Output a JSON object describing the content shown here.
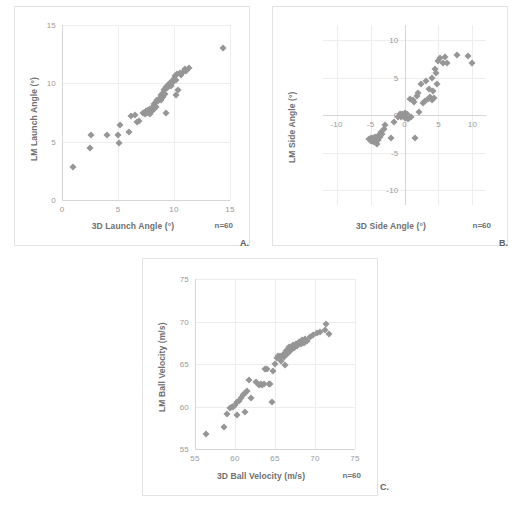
{
  "figure": {
    "caption": "",
    "panel_letters": {
      "a": "A.",
      "b": "B.",
      "c": "C."
    }
  },
  "colors": {
    "marker": "#969696",
    "grid": "#ededed",
    "axis": "#d6d6d6",
    "tick_text": "#9a9a9a",
    "title_text": "#6f6f6f",
    "panel_border": "#e3e3e3",
    "background": "#ffffff"
  },
  "chart_data": [
    {
      "id": "a",
      "type": "scatter",
      "title": "",
      "xlabel": "3D Launch Angle (°)",
      "ylabel": "LM Launch Angle (°)",
      "annotation": "n=60",
      "xlim": [
        0,
        15
      ],
      "ylim": [
        0,
        15
      ],
      "xticks": [
        0,
        5,
        10,
        15
      ],
      "yticks": [
        0,
        5,
        10,
        15
      ],
      "grid": true,
      "legend": "none",
      "n": 60,
      "points": [
        [
          1.0,
          2.8
        ],
        [
          2.5,
          4.5
        ],
        [
          2.6,
          5.6
        ],
        [
          4.0,
          5.6
        ],
        [
          5.0,
          5.6
        ],
        [
          5.1,
          4.9
        ],
        [
          5.2,
          6.4
        ],
        [
          6.0,
          5.8
        ],
        [
          6.2,
          7.2
        ],
        [
          6.5,
          7.3
        ],
        [
          6.7,
          6.7
        ],
        [
          6.9,
          6.8
        ],
        [
          7.2,
          7.5
        ],
        [
          7.4,
          7.4
        ],
        [
          7.5,
          7.6
        ],
        [
          7.6,
          7.5
        ],
        [
          7.7,
          7.7
        ],
        [
          7.8,
          7.6
        ],
        [
          7.9,
          7.8
        ],
        [
          7.9,
          7.4
        ],
        [
          8.0,
          7.9
        ],
        [
          8.0,
          7.6
        ],
        [
          8.1,
          8.0
        ],
        [
          8.2,
          7.8
        ],
        [
          8.2,
          8.2
        ],
        [
          8.3,
          8.1
        ],
        [
          8.4,
          8.4
        ],
        [
          8.4,
          8.0
        ],
        [
          8.5,
          8.6
        ],
        [
          8.6,
          8.5
        ],
        [
          8.7,
          8.7
        ],
        [
          8.8,
          8.6
        ],
        [
          8.8,
          9.0
        ],
        [
          8.9,
          8.9
        ],
        [
          9.0,
          9.2
        ],
        [
          9.0,
          8.8
        ],
        [
          9.1,
          9.4
        ],
        [
          9.2,
          9.5
        ],
        [
          9.2,
          9.1
        ],
        [
          9.3,
          9.7
        ],
        [
          9.3,
          7.5
        ],
        [
          9.4,
          9.6
        ],
        [
          9.5,
          9.9
        ],
        [
          9.6,
          10.0
        ],
        [
          9.7,
          9.8
        ],
        [
          9.8,
          10.2
        ],
        [
          9.9,
          10.1
        ],
        [
          10.0,
          10.4
        ],
        [
          10.1,
          10.6
        ],
        [
          10.2,
          10.3
        ],
        [
          10.2,
          9.0
        ],
        [
          10.3,
          10.8
        ],
        [
          10.4,
          9.4
        ],
        [
          10.5,
          10.9
        ],
        [
          10.6,
          10.7
        ],
        [
          10.8,
          11.0
        ],
        [
          11.0,
          11.2
        ],
        [
          11.1,
          11.1
        ],
        [
          11.3,
          11.3
        ],
        [
          14.4,
          13.0
        ]
      ]
    },
    {
      "id": "b",
      "type": "scatter",
      "title": "",
      "xlabel": "3D Side Angle (°)",
      "ylabel": "LM Side Angle (°)",
      "annotation": "n=60",
      "xlim": [
        -12,
        12
      ],
      "ylim": [
        -12,
        12
      ],
      "xticks": [
        -10,
        -5,
        0,
        5,
        10
      ],
      "yticks": [
        -10,
        -5,
        0,
        5,
        10
      ],
      "grid": true,
      "legend": "none",
      "n": 60,
      "points": [
        [
          -5.2,
          -3.2
        ],
        [
          -5.0,
          -3.4
        ],
        [
          -4.9,
          -3.1
        ],
        [
          -4.8,
          -3.5
        ],
        [
          -4.7,
          -3.0
        ],
        [
          -4.6,
          -3.3
        ],
        [
          -4.5,
          -3.6
        ],
        [
          -4.4,
          -2.9
        ],
        [
          -4.3,
          -3.2
        ],
        [
          -4.2,
          -3.4
        ],
        [
          -4.1,
          -3.8
        ],
        [
          -4.0,
          -3.1
        ],
        [
          -3.9,
          -3.3
        ],
        [
          -3.8,
          -2.6
        ],
        [
          -3.6,
          -2.9
        ],
        [
          -3.5,
          -2.2
        ],
        [
          -3.3,
          -2.5
        ],
        [
          -3.0,
          -1.8
        ],
        [
          -2.8,
          -1.3
        ],
        [
          -2.0,
          -3.0
        ],
        [
          -1.6,
          -0.9
        ],
        [
          -1.0,
          -0.2
        ],
        [
          -0.7,
          0.1
        ],
        [
          -0.5,
          -0.3
        ],
        [
          -0.3,
          0.2
        ],
        [
          -0.2,
          -0.1
        ],
        [
          0.0,
          0.3
        ],
        [
          0.1,
          -0.4
        ],
        [
          0.3,
          0.1
        ],
        [
          0.5,
          -0.5
        ],
        [
          0.8,
          2.2
        ],
        [
          1.0,
          -0.3
        ],
        [
          1.2,
          2.0
        ],
        [
          1.4,
          1.8
        ],
        [
          1.6,
          -3.0
        ],
        [
          1.8,
          2.6
        ],
        [
          2.0,
          3.0
        ],
        [
          2.2,
          0.4
        ],
        [
          2.5,
          4.2
        ],
        [
          2.7,
          1.6
        ],
        [
          3.0,
          1.9
        ],
        [
          3.2,
          4.6
        ],
        [
          3.4,
          2.1
        ],
        [
          3.6,
          3.5
        ],
        [
          3.8,
          2.4
        ],
        [
          4.0,
          5.0
        ],
        [
          4.1,
          2.0
        ],
        [
          4.2,
          3.2
        ],
        [
          4.3,
          2.3
        ],
        [
          4.5,
          6.2
        ],
        [
          4.7,
          5.6
        ],
        [
          5.0,
          7.2
        ],
        [
          5.3,
          7.6
        ],
        [
          5.6,
          7.0
        ],
        [
          5.9,
          7.8
        ],
        [
          6.2,
          6.9
        ],
        [
          7.8,
          8.0
        ],
        [
          9.4,
          7.9
        ],
        [
          10.0,
          7.0
        ],
        [
          4.8,
          4.2
        ]
      ]
    },
    {
      "id": "c",
      "type": "scatter",
      "title": "",
      "xlabel": "3D Ball Velocity (m/s)",
      "ylabel": "LM Ball Velocity (m/s)",
      "annotation": "n=60",
      "xlim": [
        55,
        75
      ],
      "ylim": [
        55,
        75
      ],
      "xticks": [
        55,
        60,
        65,
        70,
        75
      ],
      "yticks": [
        55,
        60,
        65,
        70,
        75
      ],
      "grid": true,
      "legend": "none",
      "n": 60,
      "points": [
        [
          56.4,
          56.8
        ],
        [
          58.6,
          57.6
        ],
        [
          59.0,
          59.1
        ],
        [
          59.4,
          59.8
        ],
        [
          59.6,
          60.0
        ],
        [
          59.8,
          59.9
        ],
        [
          60.0,
          60.2
        ],
        [
          60.2,
          60.5
        ],
        [
          60.3,
          59.0
        ],
        [
          60.5,
          60.6
        ],
        [
          60.8,
          61.0
        ],
        [
          61.0,
          61.3
        ],
        [
          61.2,
          61.6
        ],
        [
          61.3,
          59.3
        ],
        [
          61.5,
          61.8
        ],
        [
          61.7,
          63.1
        ],
        [
          62.0,
          61.0
        ],
        [
          62.6,
          62.9
        ],
        [
          63.0,
          62.5
        ],
        [
          63.2,
          62.6
        ],
        [
          63.4,
          62.5
        ],
        [
          63.6,
          62.6
        ],
        [
          63.8,
          64.4
        ],
        [
          64.0,
          64.4
        ],
        [
          64.2,
          62.6
        ],
        [
          64.4,
          62.6
        ],
        [
          64.6,
          60.5
        ],
        [
          64.8,
          64.2
        ],
        [
          65.0,
          65.0
        ],
        [
          65.2,
          65.7
        ],
        [
          65.4,
          65.9
        ],
        [
          65.6,
          66.0
        ],
        [
          65.8,
          65.4
        ],
        [
          66.0,
          66.1
        ],
        [
          66.1,
          65.8
        ],
        [
          66.2,
          66.3
        ],
        [
          66.3,
          64.9
        ],
        [
          66.4,
          66.5
        ],
        [
          66.5,
          66.2
        ],
        [
          66.6,
          66.8
        ],
        [
          66.7,
          66.4
        ],
        [
          66.8,
          67.0
        ],
        [
          67.0,
          66.6
        ],
        [
          67.2,
          67.2
        ],
        [
          67.4,
          66.9
        ],
        [
          67.6,
          67.4
        ],
        [
          67.8,
          67.1
        ],
        [
          68.0,
          67.6
        ],
        [
          68.2,
          67.3
        ],
        [
          68.4,
          67.8
        ],
        [
          68.6,
          67.5
        ],
        [
          68.8,
          68.0
        ],
        [
          69.0,
          67.7
        ],
        [
          69.4,
          68.2
        ],
        [
          69.8,
          68.4
        ],
        [
          70.2,
          68.6
        ],
        [
          70.6,
          68.8
        ],
        [
          71.2,
          69.0
        ],
        [
          71.4,
          69.7
        ],
        [
          71.8,
          68.5
        ]
      ]
    }
  ]
}
